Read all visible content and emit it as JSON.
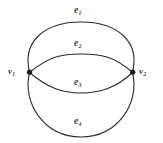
{
  "figure": {
    "name": "multigraph-two-vertices-four-parallel-edges",
    "background_color": "#ffffff",
    "stroke_color": "#2b2b2b",
    "label_color": "#3a3a3a",
    "vertex_color": "#1a1a1a"
  },
  "vertices": [
    {
      "id": "v1",
      "label": "v",
      "subscript": "1",
      "x": 29,
      "y": 72
    },
    {
      "id": "v2",
      "label": "v",
      "subscript": "2",
      "x": 133,
      "y": 72
    }
  ],
  "edges": [
    {
      "id": "e1",
      "label": "e",
      "subscript": "1",
      "from": "v1",
      "to": "v2",
      "shape": "arc-upper-outer",
      "apex_y": 22
    },
    {
      "id": "e2",
      "label": "e",
      "subscript": "2",
      "from": "v1",
      "to": "v2",
      "shape": "arc-upper-inner",
      "apex_y": 54
    },
    {
      "id": "e3",
      "label": "e",
      "subscript": "3",
      "from": "v1",
      "to": "v2",
      "shape": "arc-lower-inner",
      "apex_y": 93
    },
    {
      "id": "e4",
      "label": "e",
      "subscript": "4",
      "from": "v1",
      "to": "v2",
      "shape": "arc-lower-outer",
      "apex_y": 137
    }
  ],
  "geometry": {
    "width": 163,
    "height": 143,
    "outer_circle": {
      "cx": 81,
      "cy": 79.5,
      "rx": 58,
      "ry": 57.5
    }
  }
}
